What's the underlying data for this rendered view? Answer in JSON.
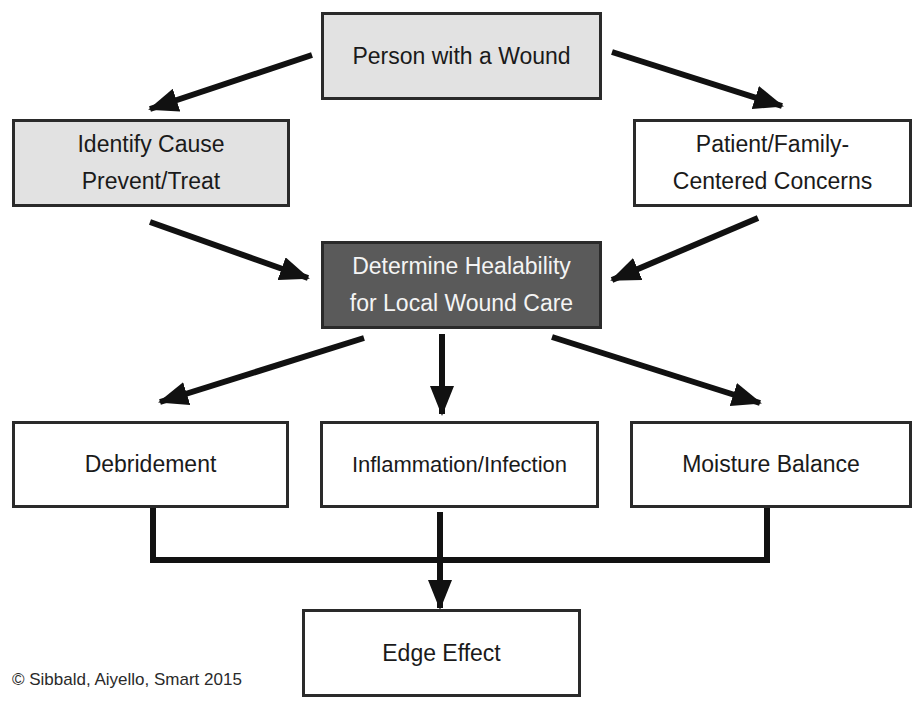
{
  "diagram": {
    "nodes": {
      "person": {
        "label": "Person with a Wound"
      },
      "identify": {
        "line1": "Identify Cause",
        "line2": "Prevent/Treat"
      },
      "patient": {
        "line1": "Patient/Family-",
        "line2": "Centered Concerns"
      },
      "healability": {
        "line1": "Determine Healability",
        "line2": "for Local Wound Care"
      },
      "debridement": {
        "label": "Debridement"
      },
      "inflammation": {
        "label": "Inflammation/Infection"
      },
      "moisture": {
        "label": "Moisture Balance"
      },
      "edge": {
        "label": "Edge Effect"
      }
    },
    "edges": [
      {
        "from": "person",
        "to": "identify"
      },
      {
        "from": "person",
        "to": "patient"
      },
      {
        "from": "identify",
        "to": "healability"
      },
      {
        "from": "patient",
        "to": "healability"
      },
      {
        "from": "healability",
        "to": "debridement"
      },
      {
        "from": "healability",
        "to": "inflammation"
      },
      {
        "from": "healability",
        "to": "moisture"
      },
      {
        "from": "debridement",
        "to": "edge"
      },
      {
        "from": "inflammation",
        "to": "edge"
      },
      {
        "from": "moisture",
        "to": "edge"
      }
    ],
    "colors": {
      "light_fill": "#e2e2e2",
      "dark_fill": "#5a5a5a",
      "stroke": "#1a1a1a"
    }
  },
  "credit": "© Sibbald, Aiyello, Smart 2015"
}
